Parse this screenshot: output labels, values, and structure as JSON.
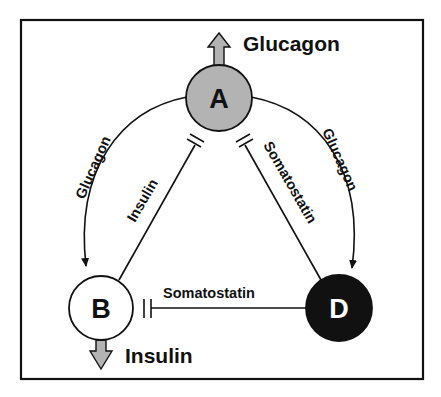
{
  "colors": {
    "cell_a_fill": "#b3b3b3",
    "cell_b_fill": "#ffffff",
    "cell_d_fill": "#111111",
    "secretion_arrow_fill": "#b3b3b3",
    "stroke": "#111111"
  },
  "nodes": {
    "a": {
      "label": "A"
    },
    "b": {
      "label": "B"
    },
    "d": {
      "label": "D"
    }
  },
  "secretions": {
    "a_output": "Glucagon",
    "b_output": "Insulin"
  },
  "edges": {
    "a_to_b": {
      "label": "Glucagon",
      "type": "stimulation"
    },
    "a_to_d": {
      "label": "Glucagon",
      "type": "stimulation"
    },
    "b_to_a": {
      "label": "Insulin",
      "type": "inhibition"
    },
    "d_to_a": {
      "label": "Somatostatin",
      "type": "inhibition"
    },
    "d_to_b": {
      "label": "Somatostatin",
      "type": "inhibition"
    }
  }
}
